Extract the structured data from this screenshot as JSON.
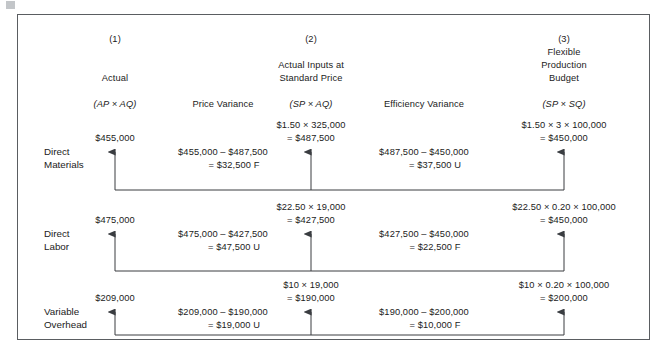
{
  "figure": {
    "columns": [
      {
        "number": "(1)",
        "title_lines": [
          "Actual"
        ],
        "formula": "(AP × AQ)"
      },
      {
        "number": "(2)",
        "title_lines": [
          "Actual Inputs at",
          "Standard Price"
        ],
        "formula": "(SP × AQ)"
      },
      {
        "number": "(3)",
        "title_lines": [
          "Flexible",
          "Production",
          "Budget"
        ],
        "formula": "(SP × SQ)"
      }
    ],
    "variance_headers": {
      "price": "Price Variance",
      "efficiency": "Efficiency Variance"
    },
    "rows": [
      {
        "label_lines": [
          "Direct",
          "Materials"
        ],
        "actual_amount": "$455,000",
        "standard_col2_lines": [
          "$1.50 × 325,000",
          "= $487,500"
        ],
        "standard_col3_lines": [
          "$1.50 × 3 × 100,000",
          "= $450,000"
        ],
        "price_variance_lines": [
          "$455,000 – $487,500",
          "= $32,500 F"
        ],
        "efficiency_variance_lines": [
          "$487,500 – $450,000",
          "= $37,500 U"
        ]
      },
      {
        "label_lines": [
          "Direct",
          "Labor"
        ],
        "actual_amount": "$475,000",
        "standard_col2_lines": [
          "$22.50 × 19,000",
          "= $427,500"
        ],
        "standard_col3_lines": [
          "$22.50 × 0.20 × 100,000",
          "= $450,000"
        ],
        "price_variance_lines": [
          "$475,000 – $427,500",
          "= $47,500 U"
        ],
        "efficiency_variance_lines": [
          "$427,500 – $450,000",
          "= $22,500 F"
        ]
      },
      {
        "label_lines": [
          "Variable",
          "Overhead"
        ],
        "actual_amount": "$209,000",
        "standard_col2_lines": [
          "$10 × 19,000",
          "= $190,000"
        ],
        "standard_col3_lines": [
          "$10 × 0.20 × 100,000",
          "= $200,000"
        ],
        "price_variance_lines": [
          "$209,000 – $190,000",
          "= $19,000 U"
        ],
        "efficiency_variance_lines": [
          "$190,000 – $200,000",
          "= $10,000 F"
        ]
      }
    ],
    "colors": {
      "border": "#5a5d61",
      "text": "#1b1b1b",
      "arrow": "#3a3d41"
    }
  }
}
